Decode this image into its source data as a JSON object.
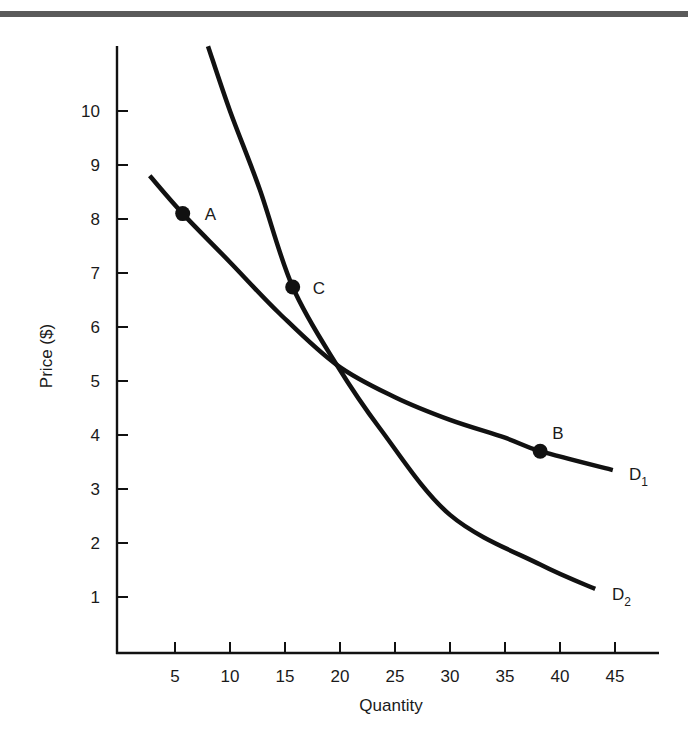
{
  "chart_data": {
    "type": "line",
    "title": "",
    "xlabel": "Quantity",
    "ylabel": "Price ($)",
    "xlim": [
      0,
      49
    ],
    "ylim": [
      0,
      11
    ],
    "x_ticks": [
      5,
      10,
      15,
      20,
      25,
      30,
      35,
      40,
      45
    ],
    "y_ticks": [
      1,
      2,
      3,
      4,
      5,
      6,
      7,
      8,
      9,
      10
    ],
    "grid": false,
    "legend": "none (curves labeled directly at right end)",
    "series": [
      {
        "name": "D1",
        "label_main": "D",
        "label_sub": "1",
        "points": [
          [
            2.7,
            8.8
          ],
          [
            5.7,
            8.1
          ],
          [
            10,
            7.2
          ],
          [
            14.5,
            6.25
          ],
          [
            19.7,
            5.3
          ],
          [
            25,
            4.7
          ],
          [
            30,
            4.28
          ],
          [
            35,
            3.95
          ],
          [
            38.2,
            3.7
          ],
          [
            44.8,
            3.35
          ]
        ]
      },
      {
        "name": "D2",
        "label_main": "D",
        "label_sub": "2",
        "points": [
          [
            8,
            11.2
          ],
          [
            10,
            10.0
          ],
          [
            12.7,
            8.55
          ],
          [
            15.7,
            6.74
          ],
          [
            19.7,
            5.3
          ],
          [
            23.6,
            4.13
          ],
          [
            30,
            2.52
          ],
          [
            38.2,
            1.6
          ],
          [
            43.2,
            1.15
          ]
        ]
      }
    ],
    "annotations": [
      {
        "label": "A",
        "x": 5.7,
        "y": 8.1,
        "curve": "D1"
      },
      {
        "label": "B",
        "x": 38.2,
        "y": 3.7,
        "curve": "D1"
      },
      {
        "label": "C",
        "x": 15.7,
        "y": 6.74,
        "curve": "D2"
      }
    ],
    "intersection": {
      "x": 19.7,
      "y": 5.3
    }
  },
  "style": {
    "ink": "#111111",
    "rule": "#5a5a5a"
  }
}
